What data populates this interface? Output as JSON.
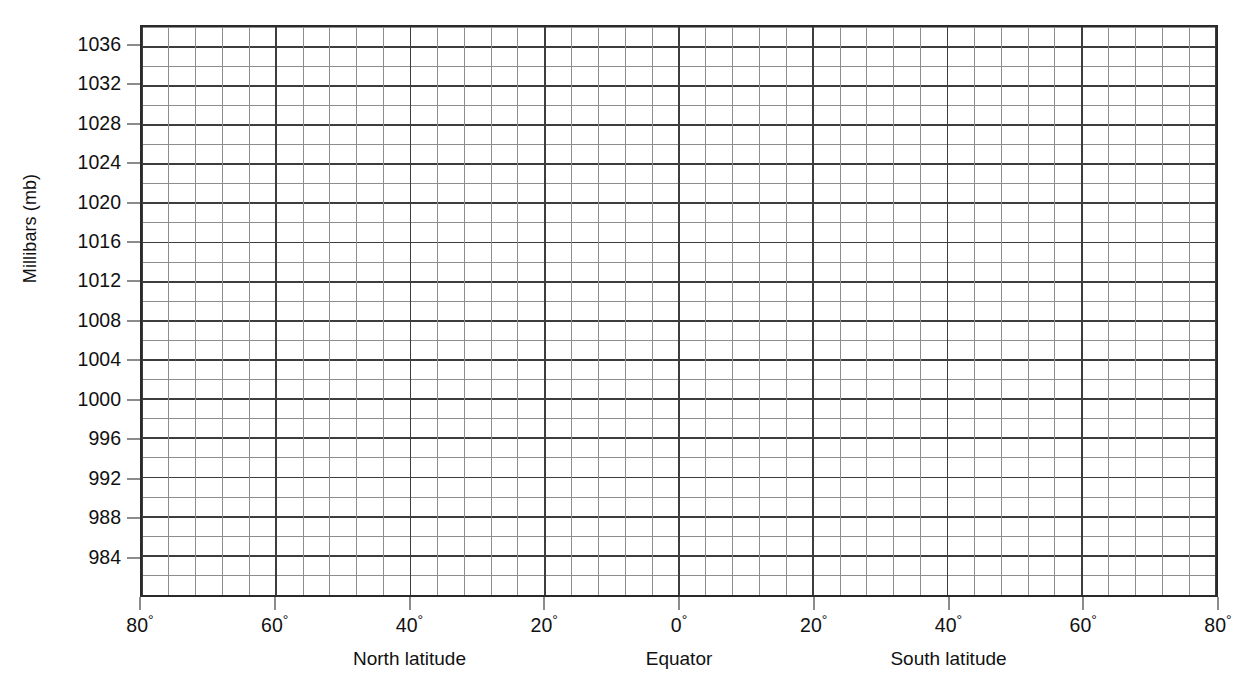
{
  "chart_data": {
    "type": "line",
    "title": "",
    "subtitle": "",
    "ylabel": "Millibars (mb)",
    "xlabel": "",
    "grid": true,
    "legend": null,
    "annotations": [],
    "note": "Blank worksheet grid — no data series plotted; axes prepared for plotting sea-level pressure against latitude.",
    "series": [],
    "y_axis": {
      "label": "Millibars (mb)",
      "unit": "mb",
      "ylim": [
        980,
        1038
      ],
      "major_step": 4,
      "minor_per_major": 2,
      "tick_values": [
        1036,
        1032,
        1028,
        1024,
        1020,
        1016,
        1012,
        1008,
        1004,
        1000,
        996,
        992,
        988,
        984
      ],
      "tick_labels": [
        "1036",
        "1032",
        "1028",
        "1024",
        "1020",
        "1016",
        "1012",
        "1008",
        "1004",
        "1000",
        "996",
        "992",
        "988",
        "984"
      ]
    },
    "x_axis": {
      "label": "",
      "unit": "degrees latitude",
      "xlim": [
        80,
        -80
      ],
      "major_step": 20,
      "minor_per_major": 5,
      "tick_values": [
        80,
        60,
        40,
        20,
        0,
        -20,
        -40,
        -60,
        -80
      ],
      "tick_labels": [
        "80",
        "60",
        "40",
        "20",
        "0",
        "20",
        "40",
        "60",
        "80"
      ],
      "tick_suffix": "°",
      "captions": [
        {
          "text": "North latitude",
          "center_value": 40
        },
        {
          "text": "Equator",
          "center_value": 0
        },
        {
          "text": "South latitude",
          "center_value": -40
        }
      ]
    }
  },
  "figure": {
    "ylabel": "Millibars (mb)",
    "y_ticks": [
      "1036",
      "1032",
      "1028",
      "1024",
      "1020",
      "1016",
      "1012",
      "1008",
      "1004",
      "1000",
      "996",
      "992",
      "988",
      "984"
    ],
    "x_ticks": [
      "80",
      "60",
      "40",
      "20",
      "0",
      "20",
      "40",
      "60",
      "80"
    ],
    "degree_symbol": "°",
    "captions": {
      "north": "North latitude",
      "equator": "Equator",
      "south": "South latitude"
    },
    "colors": {
      "background": "#ffffff",
      "frame": "#2a2a2a",
      "major_gridline": "#3d3d3d",
      "minor_gridline": "#8d8d8d",
      "text": "#111111"
    }
  }
}
